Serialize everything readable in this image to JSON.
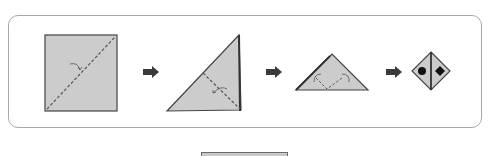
{
  "diagram": {
    "colors": {
      "paper_fill": "#cccccc",
      "outline": "#444444",
      "fold_line": "#555555",
      "arrow": "#3a3a3a",
      "frame_border": "#a8a8a8"
    },
    "steps": [
      {
        "shape": "square",
        "fold": "valley fold along diagonal"
      },
      {
        "shape": "right-triangle",
        "fold": "valley fold in half"
      },
      {
        "shape": "triangle",
        "fold": "fold both corners down"
      },
      {
        "shape": "diamond-face",
        "marks": [
          "circle",
          "diamond"
        ]
      }
    ],
    "arrows": [
      "arrow-right",
      "arrow-right",
      "arrow-right"
    ]
  }
}
